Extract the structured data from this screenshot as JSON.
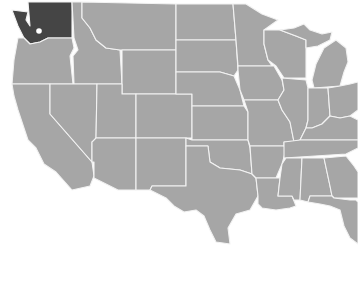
{
  "map": {
    "title": "United States map",
    "region": "Contiguous United States (western & central)",
    "highlighted_state": "Washington",
    "marker": {
      "label": "Seattle area",
      "x": 39,
      "y": 31
    },
    "colors": {
      "land": "#a6a6a6",
      "highlight": "#454545",
      "borders": "#f2f2f2",
      "water_background": "#ffffff",
      "marker": "#ffffff"
    },
    "states": [
      "Washington",
      "Oregon",
      "California",
      "Idaho",
      "Nevada",
      "Montana",
      "Wyoming",
      "Utah",
      "Arizona",
      "Colorado",
      "New Mexico",
      "North Dakota",
      "South Dakota",
      "Nebraska",
      "Kansas",
      "Oklahoma",
      "Texas",
      "Minnesota",
      "Iowa",
      "Missouri",
      "Arkansas",
      "Louisiana",
      "Wisconsin",
      "Illinois",
      "Michigan",
      "Indiana",
      "Ohio",
      "Kentucky",
      "Tennessee",
      "Mississippi",
      "Alabama",
      "Georgia",
      "Florida"
    ]
  }
}
